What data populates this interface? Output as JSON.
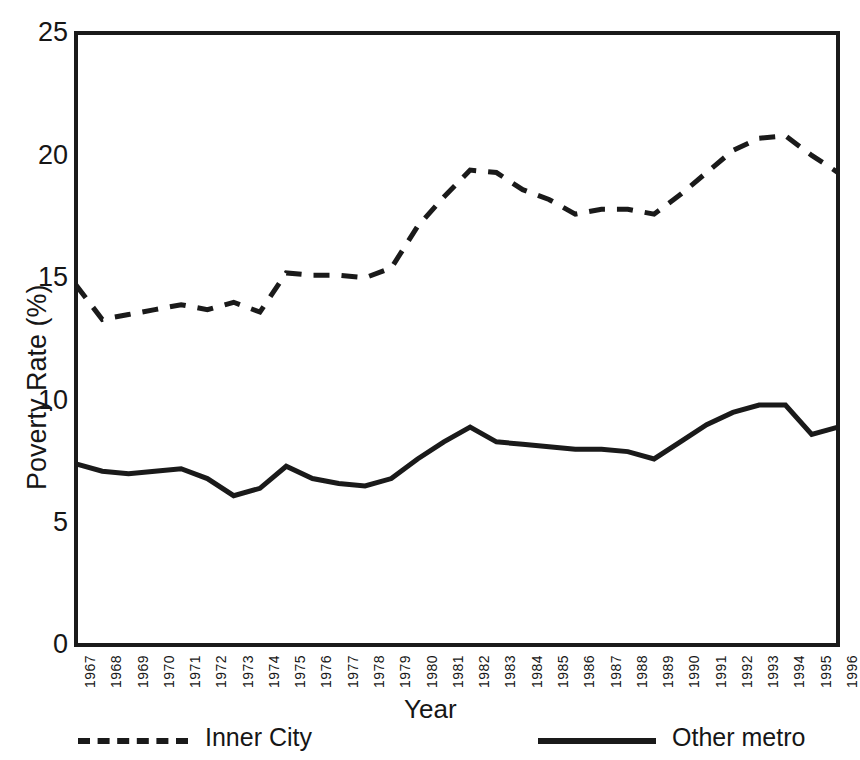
{
  "chart_data": {
    "type": "line",
    "title": "",
    "xlabel": "Year",
    "ylabel": "Poverty Rate (%)",
    "xlim": [
      1967,
      1996
    ],
    "ylim": [
      0,
      25
    ],
    "yticks": [
      0,
      5,
      10,
      15,
      20,
      25
    ],
    "grid": false,
    "legend_position": "bottom",
    "categories": [
      "1967",
      "1968",
      "1969",
      "1970",
      "1971",
      "1972",
      "1973",
      "1974",
      "1975",
      "1976",
      "1977",
      "1978",
      "1979",
      "1980",
      "1981",
      "1982",
      "1983",
      "1984",
      "1985",
      "1986",
      "1987",
      "1988",
      "1989",
      "1990",
      "1991",
      "1992",
      "1993",
      "1994",
      "1995",
      "1996"
    ],
    "series": [
      {
        "name": "Inner City",
        "style": "dashed",
        "color": "#1a1a1a",
        "values": [
          14.7,
          13.3,
          13.5,
          13.7,
          13.9,
          13.7,
          14.0,
          13.6,
          15.2,
          15.1,
          15.1,
          15.0,
          15.4,
          17.1,
          18.3,
          19.4,
          19.3,
          18.6,
          18.2,
          17.6,
          17.8,
          17.8,
          17.6,
          18.4,
          19.3,
          20.2,
          20.7,
          20.8,
          20.0,
          19.3
        ]
      },
      {
        "name": "Other metro",
        "style": "solid",
        "color": "#1a1a1a",
        "values": [
          7.4,
          7.1,
          7.0,
          7.1,
          7.2,
          6.8,
          6.1,
          6.4,
          7.3,
          6.8,
          6.6,
          6.5,
          6.8,
          7.6,
          8.3,
          8.9,
          8.3,
          8.2,
          8.1,
          8.0,
          8.0,
          7.9,
          7.6,
          8.3,
          9.0,
          9.5,
          9.8,
          9.8,
          8.6,
          8.9
        ]
      }
    ]
  },
  "axis": {
    "y_tick_labels": [
      "25",
      "20",
      "15",
      "10",
      "5",
      "0"
    ],
    "y_title": "Poverty Rate (%)",
    "x_title": "Year"
  },
  "legend": {
    "items": [
      {
        "label": "Inner City",
        "style": "dashed"
      },
      {
        "label": "Other metro",
        "style": "solid"
      }
    ]
  }
}
